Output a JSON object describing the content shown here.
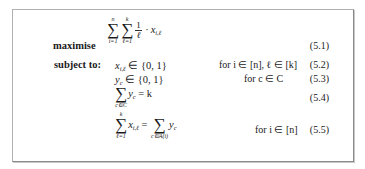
{
  "formulation": {
    "objective_keyword": "maximise",
    "constraints_keyword": "subject to:",
    "objective": {
      "outer_sum": {
        "lower": "i=1",
        "upper": "n"
      },
      "inner_sum": {
        "lower": "ℓ=1",
        "upper": "k"
      },
      "fraction_num": "1",
      "fraction_den": "ℓ",
      "term": "· x",
      "term_sub": "i,ℓ",
      "number": "(5.1)"
    },
    "constraints": [
      {
        "lhs": "x",
        "lhs_sub": "i,ℓ",
        "rel": " ∈ {0, 1}",
        "condition": "for i ∈ [n], ℓ ∈ [k]",
        "number": "(5.2)"
      },
      {
        "lhs": "y",
        "lhs_sub": "c",
        "rel": " ∈ {0, 1}",
        "condition": "for c ∈ C",
        "number": "(5.3)"
      },
      {
        "sum_lower": "c∈C",
        "term": "y",
        "term_sub": "c",
        "rel": " = k",
        "condition": "",
        "number": "(5.4)"
      },
      {
        "sum_lower": "ℓ=1",
        "sum_upper": "k",
        "term": "x",
        "term_sub": "i,ℓ",
        "rel": " = ",
        "rhs_sum_lower": "c∈A(i)",
        "rhs_term": "y",
        "rhs_term_sub": "c",
        "condition": "for i ∈ [n]",
        "number": "(5.5)"
      }
    ]
  }
}
